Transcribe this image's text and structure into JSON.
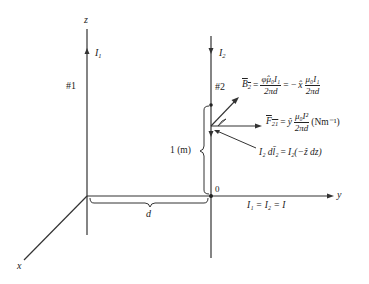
{
  "axes": {
    "z_label": "z",
    "y_label": "y",
    "x_label": "x",
    "origin_label": "0"
  },
  "wire1": {
    "number_label": "#1",
    "current_label": "I",
    "current_sub": "1",
    "direction": "up"
  },
  "wire2": {
    "number_label": "#2",
    "current_label": "I",
    "current_sub": "2",
    "direction": "down"
  },
  "dimensions": {
    "separation_label": "d",
    "segment_length_label": "1 (m)"
  },
  "equations": {
    "B2": {
      "lhs": "B",
      "lhs_sub": "2",
      "eq1": "=",
      "num1": "φ̂μ₀I₁",
      "den1": "2πd",
      "eq2": "= −",
      "unit": "x̂",
      "num2": "μ₀I₁",
      "den2": "2πd"
    },
    "F21": {
      "lhs": "F",
      "lhs_sub": "21",
      "eq": "=",
      "unit": "ŷ",
      "num": "μ₀I²",
      "den": "2πd",
      "units_text": "(Nm⁻¹)"
    },
    "dl2": {
      "text_lhs": "I₂ dl̄₂",
      "eq": "=",
      "text_rhs": "I₂(−ẑ dz)"
    },
    "currents_equal": "I₁ = I₂ = I"
  }
}
